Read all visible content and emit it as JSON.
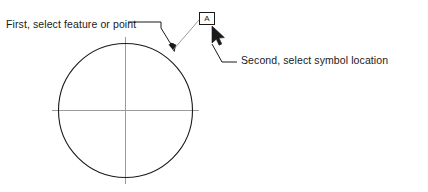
{
  "diagram": {
    "title_semantic": "datum-feature-symbol-placement-instructions",
    "annotations": {
      "first_step_label": "First, select feature or point",
      "second_step_label": "Second, select symbol location"
    },
    "datum_symbol": {
      "letter": "A",
      "box_x": 199,
      "box_y": 12,
      "box_width": 16,
      "box_height": 13
    },
    "circle": {
      "center_x": 125,
      "center_y": 110,
      "radius": 67
    },
    "centerlines": {
      "horizontal_x1": 52,
      "horizontal_x2": 199,
      "horizontal_y": 110,
      "vertical_y1": 37,
      "vertical_y2": 184,
      "vertical_x": 125
    },
    "cursor": {
      "tip_x": 212,
      "tip_y": 25
    },
    "colors": {
      "object_line": "#1a1a1a",
      "center_line": "#9a9a9a",
      "leader_line": "#1a1a1a",
      "thin_leader": "#8a8a8a",
      "text": "#1a1a1a",
      "background": "#ffffff"
    },
    "icons": {
      "cursor": "mouse-pointer-icon",
      "arrow": "arrowhead-icon"
    }
  }
}
